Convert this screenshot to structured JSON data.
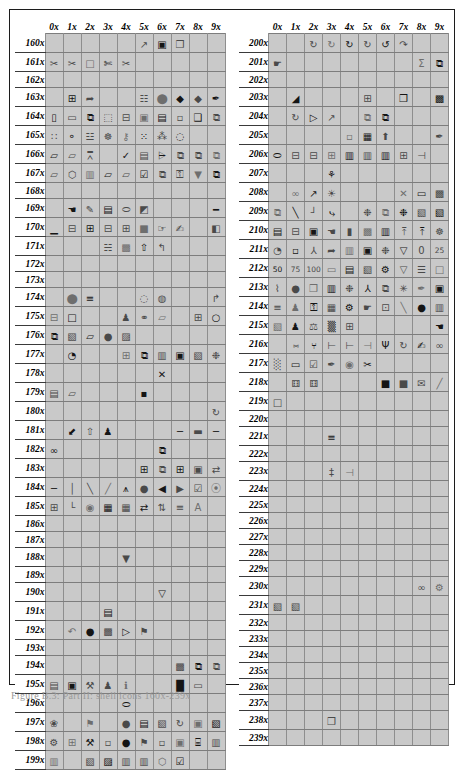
{
  "figure": {
    "caption": "Figure B.3: Part II: shell icons 160x-239x",
    "border_color": "#1c1c1c",
    "cell_fill": "#c9c9c9",
    "grid_line": "#8e8e8e",
    "page_background": "#ffffff"
  },
  "tables": [
    {
      "name": "left-icon-table",
      "column_headers": [
        "0x",
        "1x",
        "2x",
        "3x",
        "4x",
        "5x",
        "6x",
        "7x",
        "8x",
        "9x"
      ],
      "row_headers": [
        "160x",
        "161x",
        "162x",
        "163x",
        "164x",
        "165x",
        "166x",
        "167x",
        "168x",
        "169x",
        "170x",
        "171x",
        "172x",
        "173x",
        "174x",
        "175x",
        "176x",
        "177x",
        "178x",
        "179x",
        "180x",
        "181x",
        "182x",
        "183x",
        "184x",
        "185x",
        "186x",
        "187x",
        "188x",
        "189x",
        "190x",
        "191x",
        "192x",
        "193x",
        "194x",
        "195x",
        "196x",
        "197x",
        "198x",
        "199x"
      ],
      "cells": [
        [
          "",
          "",
          "",
          "",
          "",
          "chart-icon",
          "monitor-icon",
          "window-properties-icon",
          "",
          ""
        ],
        [
          "scissors-icon",
          "scissors-icon",
          "square-icon",
          "cut-paste-icon",
          "scissors-icon",
          "",
          "",
          "",
          "",
          ""
        ],
        [
          "",
          "",
          "",
          "",
          "",
          "",
          "",
          "",
          "",
          ""
        ],
        [
          "",
          "box-add-icon",
          "box-arrow-icon",
          "",
          "",
          "tree-icon",
          "fill-icon",
          "droplet-icon",
          "droplet-icon",
          "pen-icon"
        ],
        [
          "door-add-icon",
          "page-icon",
          "pages-icon",
          "globe-page-icon",
          "box-person-icon",
          "monitor-small-icon",
          "window-icon",
          "device-icon",
          "frame-icon",
          "duplicate-icon"
        ],
        [
          "percent-icon",
          "node-icon",
          "tree-add-icon",
          "network-icon",
          "lock-node-icon",
          "scatter-icon",
          "network-link-icon",
          "magnify-icon",
          "",
          ""
        ],
        [
          "folder-open-icon",
          "folder-out-icon",
          "join-icon",
          "",
          "check-icon",
          "window-refresh-icon",
          "sort-icon",
          "copy-icon",
          "window-copy-icon",
          "copy-page-icon"
        ],
        [
          "folder-icon",
          "shield-icon",
          "book-icon",
          "folder-back-icon",
          "folder-up-icon",
          "check-box-icon",
          "copy-icon",
          "key-icon",
          "filter-icon",
          "copy-page-icon"
        ],
        [
          "",
          "",
          "",
          "",
          "",
          "",
          "",
          "",
          "",
          ""
        ],
        [
          "",
          "hand-icon",
          "pencil-icon",
          "book-blue-icon",
          "eraser-icon",
          "paint-icon",
          "",
          "",
          "",
          "line-icon"
        ],
        [
          "underline-icon",
          "split-top-icon",
          "split-bottom-icon",
          "split-icon",
          "table-icon",
          "square-filled-icon",
          "hand-pointer-icon",
          "hand-write-icon",
          "",
          "paint-roller-icon"
        ],
        [
          "",
          "",
          "",
          "tree-green-icon",
          "image-icon",
          "arrow-up-icon",
          "arrow-turn-icon",
          "",
          "",
          ""
        ],
        [
          "",
          "",
          "",
          "",
          "",
          "",
          "",
          "",
          "",
          ""
        ],
        [
          "",
          "",
          "",
          "",
          "",
          "",
          "",
          "",
          "",
          ""
        ],
        [
          "",
          "balloon-icon",
          "list-icon",
          "",
          "",
          "zoom-icon",
          "zoom-glass-icon",
          "",
          "",
          "arrow-square-icon"
        ],
        [
          "window-split-icon",
          "window-new-icon",
          "",
          "",
          "person-icon",
          "link-icon",
          "folder-open-icon",
          "",
          "window-add-icon",
          "check-circle-icon",
          "refresh-icon"
        ],
        [
          "window-copy-icon",
          "window-back-icon",
          "folder-up-icon",
          "globe-icon",
          "print-preview-icon",
          "",
          "",
          "",
          "",
          ""
        ],
        [
          "",
          "hand-paint-icon",
          "",
          "",
          "window-grid-icon",
          "window-stack-icon",
          "window-panel-icon",
          "monitor-icon",
          "page-turn-icon",
          "puzzle-icon"
        ],
        [
          "",
          "",
          "",
          "",
          "",
          "",
          "x-icon",
          "",
          "",
          ""
        ],
        [
          "save-icon",
          "folder-open-icon",
          "",
          "",
          "",
          "bullet-window-icon",
          "",
          "",
          "",
          ""
        ],
        [
          "",
          "",
          "",
          "",
          "",
          "",
          "",
          "",
          "",
          "rotate-icon"
        ],
        [
          "",
          "arrow-into-icon",
          "arrow-up-icon",
          "person-icon",
          "",
          "",
          "",
          "minus-icon",
          "capsule-icon",
          "minus-icon"
        ],
        [
          "glasses-icon",
          "",
          "",
          "",
          "",
          "",
          "stack-icon",
          "",
          "",
          ""
        ],
        [
          "",
          "",
          "",
          "",
          "",
          "table-icon",
          "cascade-icon",
          "window-grid-icon",
          "window-box-icon",
          "window-swap-icon"
        ],
        [
          "line-horizontal-icon",
          "line-vertical-icon",
          "line-diagonal-icon",
          "line-diagonal2-icon",
          "align-icon",
          "globe-dark-icon",
          "align-left-icon",
          "align-right-icon",
          "checkbox-icon",
          "binoculars-icon"
        ],
        [
          "abc-icon",
          "corner-icon",
          "radio-icon",
          "form-icon",
          "form-grid-icon",
          "swap-icon",
          "updown-icon",
          "align-text-icon",
          "font-a-icon",
          ""
        ],
        [
          "",
          "",
          "",
          "",
          "",
          "",
          "",
          "",
          "",
          ""
        ],
        [
          "",
          "",
          "",
          "",
          "",
          "",
          "",
          "",
          "",
          ""
        ],
        [
          "",
          "",
          "",
          "",
          "filter-icon",
          "",
          "",
          "",
          "",
          ""
        ],
        [
          "",
          "",
          "",
          "",
          "",
          "",
          "",
          "",
          "",
          ""
        ],
        [
          "",
          "",
          "",
          "",
          "",
          "",
          "filter-outline-icon",
          "",
          "",
          ""
        ],
        [
          "",
          "",
          "",
          "database-icon",
          "",
          "",
          "",
          "",
          "",
          ""
        ],
        [
          "",
          "undo-icon",
          "globe-search-icon",
          "image-icon",
          "page-play-icon",
          "page-flag-icon",
          "",
          "",
          "",
          ""
        ],
        [
          "",
          "",
          "",
          "",
          "",
          "",
          "",
          "",
          "",
          ""
        ],
        [
          "",
          "",
          "",
          "",
          "",
          "",
          "",
          "image-frame-icon",
          "layers-icon",
          "window-copy-icon"
        ],
        [
          "window-refresh-icon",
          "window-lock-icon",
          "tools-icon",
          "runner-icon",
          "info-icon",
          "",
          "",
          "chart-bars-icon",
          "window-blank-icon",
          ""
        ],
        [
          "",
          "",
          "",
          "",
          "eraser-icon",
          "",
          "",
          "",
          "",
          ""
        ],
        [
          "bug-icon",
          "",
          "page-flag-icon",
          "",
          "globe-check-icon",
          "save-icon",
          "page-turn-icon",
          "refresh-circle-icon",
          "window-lock-icon",
          "window-back-icon"
        ],
        [
          "gear-icon",
          "window-add-icon",
          "wrench-icon",
          "window-small-icon",
          "globe-gear-icon",
          "page-flag-icon",
          "window-small-icon",
          "window-search-icon",
          "keyboard-icon",
          "book-icon"
        ],
        [
          "book-icon",
          "",
          "window-label-icon",
          "window-left-icon",
          "book-icon",
          "window-up-icon",
          "tag-icon",
          "checkbox-icon",
          "",
          ""
        ]
      ]
    },
    {
      "name": "right-icon-table",
      "column_headers": [
        "0x",
        "1x",
        "2x",
        "3x",
        "4x",
        "5x",
        "6x",
        "7x",
        "8x",
        "9x"
      ],
      "row_headers": [
        "200x",
        "201x",
        "202x",
        "203x",
        "204x",
        "205x",
        "206x",
        "207x",
        "208x",
        "209x",
        "210x",
        "211x",
        "212x",
        "213x",
        "214x",
        "215x",
        "216x",
        "217x",
        "218x",
        "219x",
        "220x",
        "221x",
        "222x",
        "223x",
        "224x",
        "225x",
        "226x",
        "227x",
        "228x",
        "229x",
        "230x",
        "231x",
        "232x",
        "233x",
        "234x",
        "235x",
        "236x",
        "237x",
        "238x",
        "239x"
      ],
      "cells": [
        [
          "",
          "",
          "refresh-icon",
          "refresh-icon",
          "refresh-icon",
          "refresh-icon",
          "refresh-box-icon",
          "refresh-arrow-icon",
          "",
          ""
        ],
        [
          "hand-point-icon",
          "",
          "",
          "",
          "",
          "",
          "",
          "",
          "sigma-icon",
          "copy-pages-icon"
        ],
        [
          "",
          "",
          "",
          "",
          "",
          "",
          "",
          "",
          "",
          ""
        ],
        [
          "",
          "window-fold-icon",
          "",
          "",
          "",
          "table-grid-icon",
          "",
          "window-properties-icon",
          "",
          "window-image-icon"
        ],
        [
          "",
          "rotate-icon",
          "page-arrow-icon",
          "chart-pen-icon",
          "",
          "copy-pages-icon",
          "copy-page-icon",
          "",
          "",
          ""
        ],
        [
          "",
          "",
          "",
          "",
          "window-small-icon",
          "table-edit-icon",
          "clipboard-up-icon",
          "",
          "",
          "pen-icon"
        ],
        [
          "eraser-icon",
          "split-h-icon",
          "split-h2-icon",
          "split-bottom-icon",
          "split-left-icon",
          "split-v-icon",
          "split-v2-icon",
          "table-top-icon",
          "table-side-icon",
          ""
        ],
        [
          "",
          "",
          "",
          "plant-icon",
          "",
          "",
          "",
          "",
          "",
          ""
        ],
        [
          "",
          "rings-icon",
          "chart-pen-icon",
          "bulb-icon",
          "",
          "",
          "",
          "x-cut-icon",
          "clipboard-icon",
          "image-frame-icon"
        ],
        [
          "pages-icon",
          "node-line-icon",
          "node-path-icon",
          "node-curve-icon",
          "",
          "group-icon",
          "window-group-icon",
          "group-box-icon",
          "window-label-icon",
          "window-plug-icon"
        ],
        [
          "server-icon",
          "window-split-icon",
          "window-node-icon",
          "hand-dark-icon",
          "page-dark-icon",
          "image-box-icon",
          "window-panel-icon",
          "align-top-icon",
          "align-top2-icon",
          "group-net-icon"
        ],
        [
          "clock-icon",
          "window-dot-icon",
          "branch-icon",
          "box-arrow-icon",
          "book-open-icon",
          "camera-icon",
          "group-small-icon",
          "shape-icon",
          "zero-exp-icon",
          "twentyfive-exp-icon"
        ],
        [
          "fifty-exp-icon",
          "seventyfive-exp-icon",
          "hundred-exp-icon",
          "page-add-icon",
          "drawer-icon",
          "window-pen-icon",
          "group-gear-icon",
          "funnel-icon",
          "ladder-icon",
          "window-exp-icon"
        ],
        [
          "pulse-icon",
          "circle-dark-icon",
          "window-properties-icon",
          "window-book-icon",
          "puzzle-icon",
          "branch-small-icon",
          "page-copy-icon",
          "asterisk-icon",
          "pen-icon",
          "bag-icon"
        ],
        [
          "list-percent-icon",
          "person-icon",
          "lock-icon",
          "grid-image-icon",
          "gear-circle-icon",
          "hand-point-icon",
          "table-h-icon",
          "line-chart-icon",
          "circle-dark-icon",
          "window-up-icon"
        ],
        [
          "window-back-icon",
          "runner-icon",
          "scale-icon",
          "comb-icon",
          "table-icon",
          "",
          "",
          "",
          "",
          "hand-dark-icon"
        ],
        [
          "",
          "branch-c-icon",
          "person-wide-icon",
          "branch-box-icon",
          "branch-right-icon",
          "branch-out-icon",
          "antenna-icon",
          "circle-arrow-icon",
          "hand-write-icon",
          "chain-icon"
        ],
        [
          "map-icon",
          "window-blank-icon",
          "window-check-icon",
          "pen-tool-icon",
          "eye-icon",
          "scissors-pct-icon",
          "",
          "",
          "",
          ""
        ],
        [
          "",
          "dice-icon",
          "dice-icon",
          "",
          "",
          "",
          "square-small-icon",
          "square-small-icon",
          "envelope-icon",
          "slash-icon"
        ],
        [
          "square-blank-icon",
          "",
          "",
          "",
          "",
          "",
          "",
          "",
          "",
          ""
        ],
        [
          "",
          "",
          "",
          "",
          "",
          "",
          "",
          "",
          "",
          ""
        ],
        [
          "",
          "",
          "",
          "text-lines-icon",
          "",
          "",
          "",
          "",
          "",
          ""
        ],
        [
          "",
          "",
          "",
          "",
          "",
          "",
          "",
          "",
          "",
          ""
        ],
        [
          "",
          "",
          "",
          "beam-icon",
          "beam-side-icon",
          "",
          "",
          "",
          "",
          ""
        ],
        [
          "",
          "",
          "",
          "",
          "",
          "",
          "",
          "",
          "",
          ""
        ],
        [
          "",
          "",
          "",
          "",
          "",
          "",
          "",
          "",
          "",
          ""
        ],
        [
          "",
          "",
          "",
          "",
          "",
          "",
          "",
          "",
          "",
          ""
        ],
        [
          "",
          "",
          "",
          "",
          "",
          "",
          "",
          "",
          "",
          ""
        ],
        [
          "",
          "",
          "",
          "",
          "",
          "",
          "",
          "",
          "",
          ""
        ],
        [
          "",
          "",
          "",
          "",
          "",
          "",
          "",
          "",
          "",
          ""
        ],
        [
          "",
          "",
          "",
          "",
          "",
          "",
          "",
          "",
          "chain-link-icon",
          "gear-small-icon"
        ],
        [
          "window-arrow-icon",
          "window-arrow2-icon",
          "",
          "",
          "",
          "",
          "",
          "",
          "",
          ""
        ],
        [
          "",
          "",
          "",
          "",
          "",
          "",
          "",
          "",
          "",
          ""
        ],
        [
          "",
          "",
          "",
          "",
          "",
          "",
          "",
          "",
          "",
          ""
        ],
        [
          "",
          "",
          "",
          "",
          "",
          "",
          "",
          "",
          "",
          ""
        ],
        [
          "",
          "",
          "",
          "",
          "",
          "",
          "",
          "",
          "",
          ""
        ],
        [
          "",
          "",
          "",
          "",
          "",
          "",
          "",
          "",
          "",
          ""
        ],
        [
          "",
          "",
          "",
          "",
          "",
          "",
          "",
          "",
          "",
          ""
        ],
        [
          "",
          "",
          "",
          "window-properties-icon",
          "",
          "",
          "",
          "",
          "",
          ""
        ],
        [
          "",
          "",
          "",
          "",
          "",
          "",
          "",
          "",
          "",
          ""
        ]
      ]
    }
  ]
}
